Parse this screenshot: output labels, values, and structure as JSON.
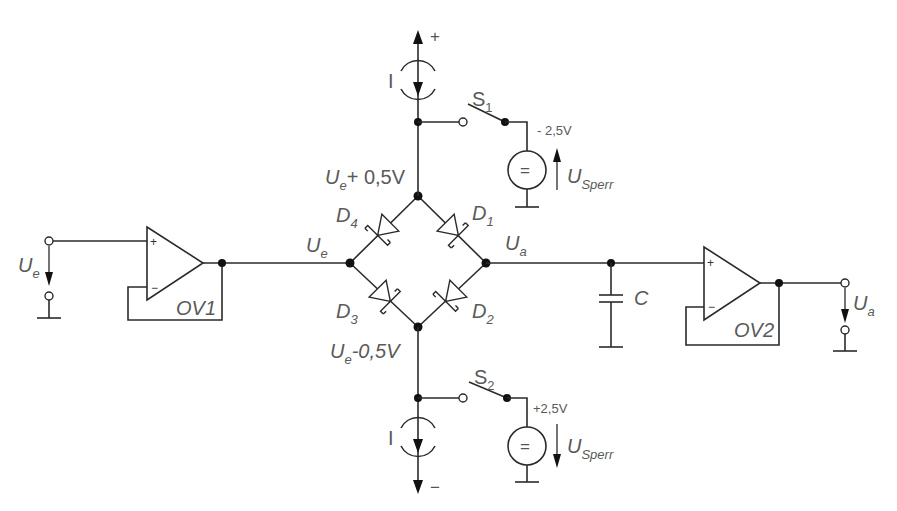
{
  "figure": {
    "type": "circuit-schematic"
  },
  "labels": {
    "input_voltage": {
      "main": "U",
      "sub": "e"
    },
    "output_voltage": {
      "main": "U",
      "sub": "a"
    },
    "bridge_input": {
      "main": "U",
      "sub": "e"
    },
    "bridge_output": {
      "main": "U",
      "sub": "a"
    },
    "top_node": {
      "main": "U",
      "sub": "e",
      "suffix": "+ 0,5V"
    },
    "bottom_node": {
      "main": "U",
      "sub": "e",
      "suffix": "-0,5V"
    },
    "opamp1": "OV1",
    "opamp2": "OV2",
    "capacitor": "C",
    "current_source_top": "I",
    "current_source_bottom": "I",
    "supply_top": "+",
    "supply_bottom": "−",
    "switch1": {
      "main": "S",
      "sub": "1"
    },
    "switch2": {
      "main": "S",
      "sub": "2"
    },
    "bias1_voltage": "- 2,5V",
    "bias2_voltage": "+2,5V",
    "bias1_source": {
      "main": "U",
      "sub": "Sperr"
    },
    "bias2_source": {
      "main": "U",
      "sub": "Sperr"
    },
    "dc_symbol": "=",
    "opamp_plus": "+",
    "opamp_minus": "−"
  },
  "diodes": [
    {
      "name": "D",
      "sub": "1",
      "type": "schottky",
      "from": "top",
      "to": "Ua"
    },
    {
      "name": "D",
      "sub": "2",
      "type": "schottky",
      "from": "Ua",
      "to": "bottom"
    },
    {
      "name": "D",
      "sub": "3",
      "type": "schottky",
      "from": "Ue",
      "to": "bottom"
    },
    {
      "name": "D",
      "sub": "4",
      "type": "schottky",
      "from": "top",
      "to": "Ue"
    }
  ]
}
